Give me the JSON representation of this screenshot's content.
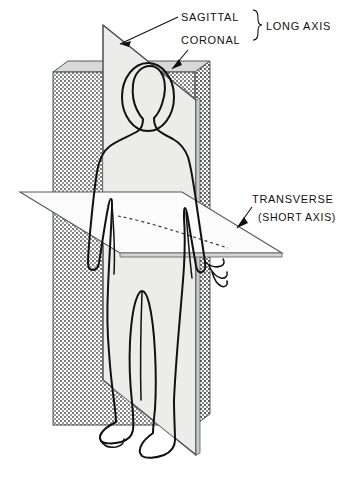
{
  "diagram": {
    "type": "anatomical-plane-diagram",
    "background_color": "#ffffff",
    "ink_color": "#111111",
    "labels": {
      "sagittal": "SAGITTAL",
      "coronal": "CORONAL",
      "long_axis": "LONG AXIS",
      "transverse": "TRANSVERSE",
      "short_axis": "(SHORT AXIS)"
    },
    "planes": [
      {
        "name": "sagittal",
        "label": "SAGITTAL",
        "axis_group": "LONG AXIS",
        "orientation": "vertical, divides body into left and right halves",
        "fill_style": "light-gray-solid",
        "fill_color": "#e9e9e7"
      },
      {
        "name": "coronal",
        "label": "CORONAL",
        "axis_group": "LONG AXIS",
        "orientation": "vertical, divides body into front and back halves",
        "fill_style": "stipple-halftone",
        "fill_color": "#ffffff"
      },
      {
        "name": "transverse",
        "label": "TRANSVERSE",
        "axis_group": "SHORT AXIS",
        "sub_label": "(SHORT AXIS)",
        "orientation": "horizontal, divides body into upper and lower halves",
        "fill_style": "white-solid",
        "fill_color": "#fbfbfb"
      }
    ],
    "axis_groups": [
      {
        "name": "LONG AXIS",
        "members": [
          "SAGITTAL",
          "CORONAL"
        ]
      },
      {
        "name": "SHORT AXIS",
        "members": [
          "TRANSVERSE"
        ]
      }
    ],
    "subject": {
      "name": "human-figure",
      "pose": "standing, arms at sides, frontal view",
      "rendering": "line outline"
    }
  }
}
